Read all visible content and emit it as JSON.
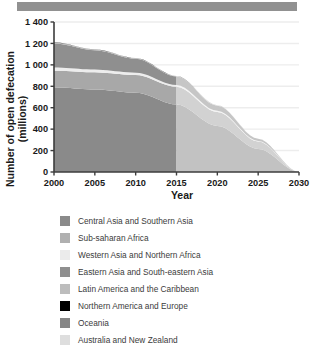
{
  "header": {
    "bar_color": "#919191"
  },
  "chart_data": {
    "type": "area",
    "stacked": true,
    "title": "",
    "xlabel": "Year",
    "ylabel": "Number of open defecation (millions)",
    "ylabel_line1": "Number of open defecation",
    "ylabel_line2": "(millions)",
    "xlim": [
      2000,
      2030
    ],
    "ylim": [
      0,
      1400
    ],
    "xticks": [
      2000,
      2005,
      2010,
      2015,
      2020,
      2025,
      2030
    ],
    "xticklabels": [
      "2000",
      "2005",
      "2010",
      "2015",
      "2020",
      "2025",
      "2030"
    ],
    "yticks": [
      0,
      200,
      400,
      600,
      800,
      1000,
      1200,
      1400
    ],
    "yticklabels": [
      "0",
      "200",
      "400",
      "600",
      "800",
      "1 000",
      "1 200",
      "1 400"
    ],
    "grid": "horizontal",
    "legend_position": "below",
    "historical_end": 2015,
    "projection_end": 2030,
    "x": [
      2000,
      2005,
      2010,
      2015,
      2020,
      2025,
      2030
    ],
    "series": [
      {
        "name": "Central Asia and Southern Asia",
        "color": "#8a8a8a",
        "projected_color": "#c2c2c2",
        "values": [
          790,
          770,
          740,
          630,
          430,
          215,
          0
        ]
      },
      {
        "name": "Sub-saharan Africa",
        "color": "#a8a8a8",
        "projected_color": "#d2d2d2",
        "values": [
          155,
          160,
          165,
          165,
          130,
          70,
          0
        ]
      },
      {
        "name": "Western Asia and Northern Africa",
        "color": "#ededed",
        "projected_color": "#f4f4f4",
        "values": [
          30,
          26,
          22,
          16,
          11,
          5,
          0
        ]
      },
      {
        "name": "Eastern Asia and South-eastern Asia",
        "color": "#8f8f8f",
        "projected_color": "#c6c6c6",
        "values": [
          225,
          180,
          130,
          80,
          48,
          20,
          0
        ]
      },
      {
        "name": "Latin America and the Caribbean",
        "color": "#b5b5b5",
        "projected_color": "#dcdcdc",
        "values": [
          9,
          7,
          6,
          4,
          3,
          1,
          0
        ]
      },
      {
        "name": "Northern America and Europe",
        "color": "#000000",
        "projected_color": "#555555",
        "values": [
          1,
          1,
          1,
          1,
          1,
          0,
          0
        ]
      },
      {
        "name": "Oceania",
        "color": "#878787",
        "projected_color": "#bdbdbd",
        "values": [
          1,
          1,
          1,
          1,
          1,
          0,
          0
        ]
      },
      {
        "name": "Australia and New Zealand",
        "color": "#dedede",
        "projected_color": "#ededed",
        "values": [
          0,
          0,
          0,
          0,
          0,
          0,
          0
        ]
      }
    ],
    "totals": [
      1211,
      1145,
      1065,
      897,
      624,
      311,
      0
    ]
  },
  "legend": {
    "items": [
      {
        "label": "Central Asia and Southern Asia",
        "color": "#8a8a8a"
      },
      {
        "label": "Sub-saharan Africa",
        "color": "#b0b0b0"
      },
      {
        "label": "Western Asia and Northern Africa",
        "color": "#ebebeb"
      },
      {
        "label": "Eastern Asia and South-eastern Asia",
        "color": "#8f8f8f"
      },
      {
        "label": "Latin America and the Caribbean",
        "color": "#bdbdbd"
      },
      {
        "label": "Northern America and Europe",
        "color": "#000000"
      },
      {
        "label": "Oceania",
        "color": "#868686"
      },
      {
        "label": "Australia and New Zealand",
        "color": "#dedede"
      }
    ]
  }
}
